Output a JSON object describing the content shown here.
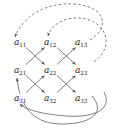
{
  "figure": {
    "kind": "directed-graph-diagram",
    "width": 124,
    "height": 132,
    "background_color": "#ffffff",
    "stroke_color": "#4a4a4a",
    "label_color": "#1a1a1a"
  },
  "nodes": [
    {
      "id": "a11",
      "base": "a",
      "sub": "11",
      "x": 20,
      "y": 42,
      "row": 1,
      "col": 1
    },
    {
      "id": "a12",
      "base": "a",
      "sub": "12",
      "x": 50,
      "y": 42,
      "row": 1,
      "col": 2
    },
    {
      "id": "a13",
      "base": "a",
      "sub": "13",
      "x": 81,
      "y": 42,
      "row": 1,
      "col": 3
    },
    {
      "id": "a21",
      "base": "a",
      "sub": "21",
      "x": 20,
      "y": 70,
      "row": 2,
      "col": 1
    },
    {
      "id": "a22",
      "base": "a",
      "sub": "22",
      "x": 50,
      "y": 70,
      "row": 2,
      "col": 2
    },
    {
      "id": "a23",
      "base": "a",
      "sub": "23",
      "x": 81,
      "y": 70,
      "row": 2,
      "col": 3
    },
    {
      "id": "a31",
      "base": "a",
      "sub": "31",
      "x": 20,
      "y": 98,
      "row": 3,
      "col": 1
    },
    {
      "id": "a32",
      "base": "a",
      "sub": "32",
      "x": 50,
      "y": 98,
      "row": 3,
      "col": 2
    },
    {
      "id": "a33",
      "base": "a",
      "sub": "33",
      "x": 81,
      "y": 98,
      "row": 3,
      "col": 3
    }
  ],
  "edges": [
    {
      "id": "e-a21-a12",
      "from": "a21",
      "to": "a12",
      "style": "solid",
      "kind": "diagonal-up"
    },
    {
      "id": "e-a11-a22",
      "from": "a11",
      "to": "a22",
      "style": "solid",
      "kind": "diagonal-down"
    },
    {
      "id": "e-a31-a22",
      "from": "a31",
      "to": "a22",
      "style": "solid",
      "kind": "diagonal-up"
    },
    {
      "id": "e-a21-a32",
      "from": "a21",
      "to": "a32",
      "style": "solid",
      "kind": "diagonal-down"
    },
    {
      "id": "e-a22-a13",
      "from": "a22",
      "to": "a13",
      "style": "solid",
      "kind": "diagonal-up"
    },
    {
      "id": "e-a12-a23",
      "from": "a12",
      "to": "a23",
      "style": "solid",
      "kind": "diagonal-down"
    },
    {
      "id": "e-a32-a23",
      "from": "a32",
      "to": "a23",
      "style": "solid",
      "kind": "diagonal-up"
    },
    {
      "id": "e-a22-a33",
      "from": "a22",
      "to": "a33",
      "style": "solid",
      "kind": "diagonal-down"
    }
  ],
  "arcs": [
    {
      "id": "arc-a13-a11",
      "from": "a13",
      "to": "a11",
      "style": "dashed",
      "side": "top",
      "label": ""
    },
    {
      "id": "arc-a23-a12",
      "from": "a23",
      "to": "a12",
      "style": "dashed",
      "side": "top",
      "label": ""
    },
    {
      "id": "arc-a33-a21",
      "from": "a33",
      "to": "a21",
      "style": "solid",
      "side": "bottom",
      "label": ""
    },
    {
      "id": "arc-a33-a31",
      "from": "a33",
      "to": "a31",
      "style": "solid",
      "side": "bottom",
      "label": ""
    }
  ],
  "legend": {
    "solid_meaning": "",
    "dashed_meaning": ""
  }
}
